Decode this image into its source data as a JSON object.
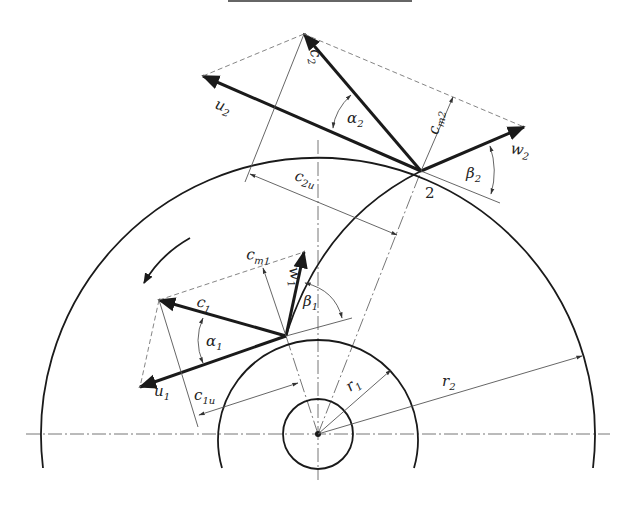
{
  "figure": {
    "type": "velocity-triangles-centrifugal-impeller",
    "top_rule": true
  },
  "labels": {
    "c2": "c",
    "c2_sub": "2",
    "u2": "u",
    "u2_sub": "2",
    "alpha2": "α",
    "alpha2_sub": "2",
    "cm2": "c",
    "cm2_sub": "m2",
    "w2": "w",
    "w2_sub": "2",
    "beta2": "β",
    "beta2_sub": "2",
    "c2u": "c",
    "c2u_sub": "2u",
    "point2": "2",
    "cm1": "c",
    "cm1_sub": "m1",
    "w1": "w",
    "w1_sub": "1",
    "c1": "c",
    "c1_sub": "1",
    "beta1": "β",
    "beta1_sub": "1",
    "alpha1": "α",
    "alpha1_sub": "1",
    "u1": "u",
    "u1_sub": "1",
    "c1u": "c",
    "c1u_sub": "1u",
    "r1": "r",
    "r1_sub": "1",
    "r2": "r",
    "r2_sub": "2"
  },
  "colors": {
    "ink": "#1a1a1a",
    "thin": "#555555",
    "background": "#ffffff"
  }
}
